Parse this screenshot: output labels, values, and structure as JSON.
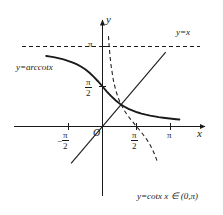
{
  "figure": {
    "background_color": "#ffffff",
    "curve_color": "#1a1a1a",
    "axis_color": "#1a1a1a"
  },
  "axes": {
    "x_axis_name": "x",
    "y_axis_name": "y",
    "origin_label": "O",
    "x_ticks": [
      {
        "label_num": "π",
        "label_den": "2",
        "negative": true,
        "value": -1.5708,
        "fraction": true
      },
      {
        "label_num": "π",
        "label_den": "2",
        "negative": false,
        "value": 1.5708,
        "fraction": true
      },
      {
        "label_num": "π",
        "label_den": "",
        "negative": false,
        "value": 3.1416,
        "fraction": false
      }
    ],
    "y_ticks": [
      {
        "label_num": "π",
        "label_den": "2",
        "value": 1.5708,
        "fraction": true
      },
      {
        "label_num": "π",
        "label_den": "",
        "value": 3.1416,
        "fraction": false
      }
    ]
  },
  "labels": {
    "arccot_label": "y=arccotx",
    "identity_label": "y=x",
    "cot_label": "y=cotx x ∈ (0,π)",
    "pi_y": "π",
    "pi_x": "π",
    "pi_half": "π",
    "two": "2",
    "minus": "−",
    "x_letter": "x",
    "y_letter": "y",
    "origin": "O"
  },
  "chart_data": {
    "type": "line",
    "xlabel": "x",
    "ylabel": "y",
    "xlim": [
      -2.7,
      3.9
    ],
    "ylim": [
      -1.6,
      4.0
    ],
    "grid": false,
    "legend": "inline annotations",
    "asymptotes": [
      {
        "type": "horizontal",
        "y": 3.1416,
        "style": "dashed",
        "label": "π"
      },
      {
        "type": "horizontal",
        "y": 0,
        "style": "solid",
        "label": "x-axis"
      }
    ],
    "series": [
      {
        "name": "y=arccotx",
        "style": "solid",
        "width": 1.9,
        "domain": [
          -2.6,
          3.55
        ],
        "formula": "arccot(x)",
        "points": [
          [
            -2.6,
            2.771
          ],
          [
            -2.4,
            2.746
          ],
          [
            -2.2,
            2.716
          ],
          [
            -2.0,
            2.678
          ],
          [
            -1.8,
            2.634
          ],
          [
            -1.6,
            2.581
          ],
          [
            -1.4,
            2.52
          ],
          [
            -1.2,
            2.449
          ],
          [
            -1.0,
            2.356
          ],
          [
            -0.8,
            2.246
          ],
          [
            -0.6,
            2.111
          ],
          [
            -0.4,
            1.951
          ],
          [
            -0.2,
            1.768
          ],
          [
            0.0,
            1.571
          ],
          [
            0.2,
            1.373
          ],
          [
            0.4,
            1.19
          ],
          [
            0.6,
            1.03
          ],
          [
            0.8,
            0.896
          ],
          [
            1.0,
            0.785
          ],
          [
            1.2,
            0.695
          ],
          [
            1.4,
            0.62
          ],
          [
            1.6,
            0.559
          ],
          [
            1.8,
            0.507
          ],
          [
            2.0,
            0.464
          ],
          [
            2.2,
            0.426
          ],
          [
            2.4,
            0.395
          ],
          [
            2.6,
            0.367
          ],
          [
            2.8,
            0.343
          ],
          [
            3.0,
            0.322
          ],
          [
            3.2,
            0.303
          ],
          [
            3.4,
            0.285
          ],
          [
            3.55,
            0.274
          ]
        ]
      },
      {
        "name": "y=cotx",
        "style": "dashed",
        "width": 1.1,
        "domain": [
          0.27,
          2.86
        ],
        "formula": "cot(x)",
        "points": [
          [
            0.275,
            3.55
          ],
          [
            0.3,
            3.233
          ],
          [
            0.35,
            2.747
          ],
          [
            0.4,
            2.365
          ],
          [
            0.5,
            1.83
          ],
          [
            0.6,
            1.462
          ],
          [
            0.7,
            1.187
          ],
          [
            0.8,
            0.971
          ],
          [
            0.9,
            0.793
          ],
          [
            1.0,
            0.642
          ],
          [
            1.1,
            0.509
          ],
          [
            1.2,
            0.391
          ],
          [
            1.3,
            0.282
          ],
          [
            1.4,
            0.18
          ],
          [
            1.5,
            0.071
          ],
          [
            1.5708,
            0.0
          ],
          [
            1.7,
            -0.129
          ],
          [
            1.8,
            -0.233
          ],
          [
            1.9,
            -0.343
          ],
          [
            2.0,
            -0.458
          ],
          [
            2.1,
            -0.584
          ],
          [
            2.2,
            -0.725
          ],
          [
            2.3,
            -0.887
          ],
          [
            2.4,
            -1.077
          ],
          [
            2.5,
            -1.303
          ],
          [
            2.55,
            -1.43
          ]
        ]
      },
      {
        "name": "y=x",
        "style": "solid",
        "width": 1.1,
        "formula": "x",
        "points": [
          [
            -1.45,
            -1.45
          ],
          [
            2.92,
            2.92
          ]
        ]
      }
    ],
    "annotations": [
      {
        "text": "y=arccotx",
        "x": -2.3,
        "y": 2.25
      },
      {
        "text": "y=x",
        "x": 2.7,
        "y": 3.5
      },
      {
        "text": "y=cotx x ∈ (0,π)",
        "x": 2.1,
        "y": -1.38
      }
    ]
  }
}
